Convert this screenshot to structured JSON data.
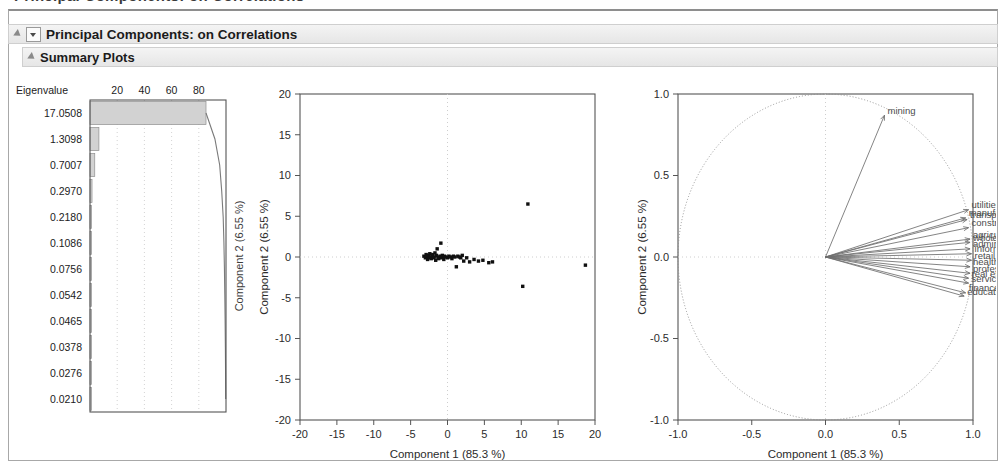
{
  "window": {
    "clipped_title": "Principal Components: on Correlations"
  },
  "headers": {
    "primary": "Principal Components: on Correlations",
    "secondary": "Summary Plots"
  },
  "scree": {
    "column_header": "Eigenvalue",
    "pct_ticks": [
      "20",
      "40",
      "60",
      "80"
    ],
    "eigenvalues": [
      "17.0508",
      "1.3098",
      "0.7007",
      "0.2970",
      "0.2180",
      "0.1086",
      "0.0756",
      "0.0542",
      "0.0465",
      "0.0378",
      "0.0276",
      "0.0210"
    ],
    "side_label": "Component 2 (6.55 %)"
  },
  "score_plot": {
    "xlabel": "Component 1  (85.3 %)",
    "ylabel": "Component 2 (6.55 %)",
    "xticks": [
      "-20",
      "-15",
      "-10",
      "-5",
      "0",
      "5",
      "10",
      "15",
      "20"
    ],
    "yticks": [
      "-20",
      "-15",
      "-10",
      "-5",
      "0",
      "5",
      "10",
      "15",
      "20"
    ]
  },
  "loading_plot": {
    "xlabel": "Component 1  (85.3 %)",
    "ylabel": "Component 2 (6.55 %)",
    "xticks": [
      "-1.0",
      "-0.5",
      "0.0",
      "0.5",
      "1.0"
    ],
    "yticks": [
      "-1.0",
      "-0.5",
      "0.0",
      "0.5",
      "1.0"
    ]
  },
  "colors": {
    "frame": "#a8a8a8",
    "header_bg": "#ececec",
    "axis": "#555555",
    "grid": "#c8c8c8",
    "point": "#101010",
    "vector": "#6e6e6e",
    "bar_fill": "#d2d2d2",
    "circle": "#8c8c8c"
  },
  "chart_data": [
    {
      "type": "bar",
      "title": "Scree / variance explained",
      "categories": [
        "17.0508",
        "1.3098",
        "0.7007",
        "0.2970",
        "0.2180",
        "0.1086",
        "0.0756",
        "0.0542",
        "0.0465",
        "0.0378",
        "0.0276",
        "0.0210"
      ],
      "values": [
        85.3,
        6.55,
        3.5,
        1.49,
        1.09,
        0.54,
        0.38,
        0.27,
        0.23,
        0.19,
        0.14,
        0.11
      ],
      "cumulative": [
        85.3,
        91.85,
        95.35,
        96.84,
        97.93,
        98.47,
        98.85,
        99.12,
        99.35,
        99.54,
        99.68,
        99.79
      ],
      "xlabel": "",
      "ylabel": "Eigenvalue",
      "xlim": [
        0,
        100
      ],
      "xticks": [
        20,
        40,
        60,
        80
      ],
      "grid": true,
      "legend": "none"
    },
    {
      "type": "scatter",
      "title": "Score plot",
      "xlabel": "Component 1  (85.3 %)",
      "ylabel": "Component 2 (6.55 %)",
      "xlim": [
        -20,
        20
      ],
      "ylim": [
        -20,
        20
      ],
      "xticks": [
        -20,
        -15,
        -10,
        -5,
        0,
        5,
        10,
        15,
        20
      ],
      "yticks": [
        -20,
        -15,
        -10,
        -5,
        0,
        5,
        10,
        15,
        20
      ],
      "grid": true,
      "legend": "none",
      "points": [
        [
          -3.2,
          0.1
        ],
        [
          -3.0,
          -0.1
        ],
        [
          -2.9,
          0.3
        ],
        [
          -2.8,
          0.0
        ],
        [
          -2.7,
          -0.3
        ],
        [
          -2.6,
          0.2
        ],
        [
          -2.5,
          -0.1
        ],
        [
          -2.4,
          0.4
        ],
        [
          -2.3,
          0.0
        ],
        [
          -2.2,
          -0.2
        ],
        [
          -2.1,
          0.1
        ],
        [
          -2.0,
          0.3
        ],
        [
          -1.9,
          -0.1
        ],
        [
          -1.8,
          0.0
        ],
        [
          -1.7,
          0.5
        ],
        [
          -1.6,
          -0.4
        ],
        [
          -1.5,
          0.2
        ],
        [
          -1.4,
          1.0
        ],
        [
          -1.3,
          0.0
        ],
        [
          -1.2,
          -0.2
        ],
        [
          -1.0,
          0.1
        ],
        [
          -0.9,
          1.7
        ],
        [
          -0.8,
          -0.1
        ],
        [
          -0.7,
          0.2
        ],
        [
          -0.6,
          0.0
        ],
        [
          -0.5,
          -0.3
        ],
        [
          -0.4,
          0.1
        ],
        [
          -0.2,
          0.0
        ],
        [
          0.0,
          -0.1
        ],
        [
          0.2,
          0.1
        ],
        [
          0.4,
          0.0
        ],
        [
          0.6,
          -0.2
        ],
        [
          0.8,
          0.1
        ],
        [
          1.0,
          0.0
        ],
        [
          1.2,
          -1.2
        ],
        [
          1.4,
          0.1
        ],
        [
          1.6,
          0.0
        ],
        [
          1.8,
          -0.1
        ],
        [
          2.0,
          0.2
        ],
        [
          2.2,
          -0.5
        ],
        [
          2.6,
          -0.1
        ],
        [
          3.0,
          -0.6
        ],
        [
          3.6,
          -0.3
        ],
        [
          4.2,
          -0.5
        ],
        [
          4.8,
          -0.4
        ],
        [
          5.6,
          -0.7
        ],
        [
          6.1,
          -0.6
        ],
        [
          10.9,
          6.5
        ],
        [
          10.2,
          -3.6
        ],
        [
          18.7,
          -1.0
        ]
      ]
    },
    {
      "type": "scatter",
      "title": "Loading plot (correlation circle)",
      "xlabel": "Component 1  (85.3 %)",
      "ylabel": "Component 2 (6.55 %)",
      "xlim": [
        -1.0,
        1.0
      ],
      "ylim": [
        -1.0,
        1.0
      ],
      "xticks": [
        -1.0,
        -0.5,
        0.0,
        0.5,
        1.0
      ],
      "yticks": [
        -1.0,
        -0.5,
        0.0,
        0.5,
        1.0
      ],
      "grid": true,
      "legend": "none",
      "unit_circle": true,
      "vectors": [
        {
          "label": "mining",
          "x": 0.4,
          "y": 0.87
        },
        {
          "label": "utilities",
          "x": 0.97,
          "y": 0.29
        },
        {
          "label": "manufacturing",
          "x": 0.95,
          "y": 0.24
        },
        {
          "label": "transportation",
          "x": 0.96,
          "y": 0.23
        },
        {
          "label": "construction",
          "x": 0.97,
          "y": 0.18
        },
        {
          "label": "agriculture",
          "x": 0.98,
          "y": 0.11
        },
        {
          "label": "wholesale",
          "x": 0.98,
          "y": 0.09
        },
        {
          "label": "administration",
          "x": 0.98,
          "y": 0.05
        },
        {
          "label": "information",
          "x": 0.99,
          "y": 0.02
        },
        {
          "label": "retail",
          "x": 0.99,
          "y": -0.02
        },
        {
          "label": "health care",
          "x": 0.98,
          "y": -0.06
        },
        {
          "label": "professional",
          "x": 0.98,
          "y": -0.1
        },
        {
          "label": "real estate",
          "x": 0.97,
          "y": -0.13
        },
        {
          "label": "services",
          "x": 0.97,
          "y": -0.16
        },
        {
          "label": "education",
          "x": 0.94,
          "y": -0.24
        },
        {
          "label": "finance",
          "x": 0.95,
          "y": -0.22
        }
      ]
    }
  ]
}
